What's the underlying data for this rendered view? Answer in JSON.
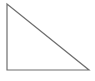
{
  "figure": {
    "type": "right-triangle",
    "background_color": "#ffffff",
    "stroke_color": "#6e6e6e",
    "stroke_width": "1.2",
    "fill_color": "none",
    "viewbox": "0 0 95 81",
    "points": "7,4 7,70 89,70",
    "vertices": [
      {
        "name": "apex-top-left",
        "x": 7,
        "y": 4
      },
      {
        "name": "right-angle-bottom-left",
        "x": 7,
        "y": 70
      },
      {
        "name": "bottom-right",
        "x": 89,
        "y": 70
      }
    ]
  }
}
